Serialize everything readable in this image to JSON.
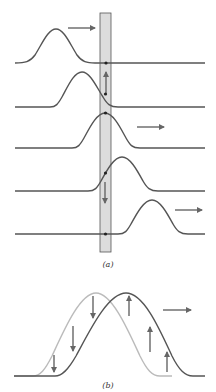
{
  "figure": {
    "part_a": {
      "label": "(a)",
      "description": "Pulse traveling right past a marked element of string; element moves up then down as pulse passes",
      "band": {
        "fill": "#d9d9d9",
        "stroke": "#555555"
      },
      "snapshots": [
        {
          "baseline_y": 64,
          "peak_x": 56,
          "element_motion": "none",
          "direction_arrow": true
        },
        {
          "baseline_y": 107,
          "peak_x": 82,
          "element_motion": "up",
          "direction_arrow": false
        },
        {
          "baseline_y": 148,
          "peak_x": 105,
          "element_motion": "none",
          "direction_arrow": true
        },
        {
          "baseline_y": 192,
          "peak_x": 126,
          "element_motion": "down",
          "direction_arrow": false
        },
        {
          "baseline_y": 234,
          "peak_x": 152,
          "element_motion": "none",
          "direction_arrow": true
        }
      ]
    },
    "part_b": {
      "label": "(b)",
      "description": "Pulse at two instants (light = earlier, dark = later) with velocity arrows of string elements",
      "velocity_arrows": [
        "down",
        "down",
        "down",
        "up",
        "up",
        "up"
      ]
    },
    "colors": {
      "curve": "#555555",
      "light_curve": "#bbbbbb",
      "arrow": "#666666",
      "dot": "#222222"
    }
  }
}
